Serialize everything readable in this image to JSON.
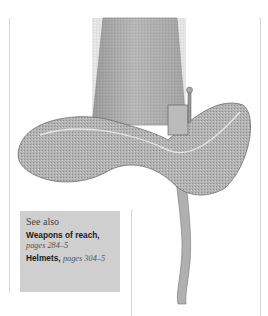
{
  "illustration": {
    "subject": "hat-shaped helmet with wide brim and curved tail",
    "colors": {
      "metal_light": "#d8d8d8",
      "metal_mid": "#a9a9a9",
      "metal_dark": "#6e6e6e"
    }
  },
  "see_also": {
    "heading": "See also",
    "background": "#cfcfcf",
    "refs": [
      {
        "title": "Weapons of reach,",
        "pages": "pages 284–5"
      },
      {
        "title": "Helmets,",
        "pages": "pages 304–5"
      }
    ]
  }
}
